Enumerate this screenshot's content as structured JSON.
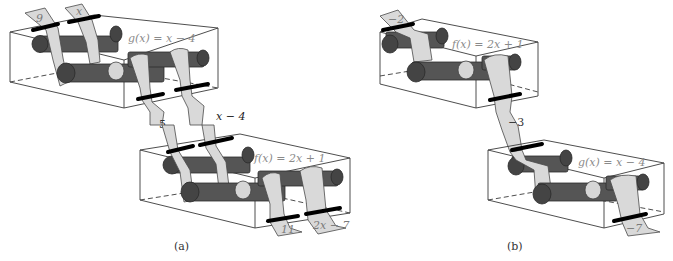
{
  "figure": {
    "panels": [
      {
        "id": "a",
        "caption": "(a)",
        "machines": [
          {
            "label": "g(x) = x − 4",
            "inputs": [
              "9",
              "x"
            ]
          },
          {
            "label": "f(x) = 2x + 1",
            "inputs": [
              "5",
              "x − 4"
            ],
            "outputs": [
              "11",
              "2x − 7"
            ]
          }
        ],
        "intermediate": {
          "numeric": "5",
          "symbolic": "x − 4"
        }
      },
      {
        "id": "b",
        "caption": "(b)",
        "machines": [
          {
            "label": "f(x) = 2x + 1",
            "inputs": [
              "−2"
            ]
          },
          {
            "label": "g(x) = x − 4",
            "inputs": [
              "−3"
            ],
            "outputs": [
              "−7"
            ]
          }
        ],
        "intermediate": {
          "numeric": "−3"
        }
      }
    ]
  }
}
